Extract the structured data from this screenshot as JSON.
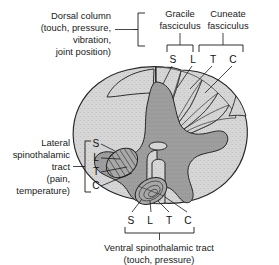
{
  "figure": {
    "colors": {
      "white_matter": "#d6d6d6",
      "gray_matter": "#9e9e9e",
      "dorsal_column_band": "#b0b0b0",
      "tract_fill": "#a8a8a8",
      "outline": "#262626",
      "text": "#1a1a1a",
      "background": "#ffffff"
    }
  },
  "labels": {
    "dorsal_column": {
      "lines": [
        "Dorsal column",
        "(touch, pressure,",
        "vibration,",
        "joint position)"
      ]
    },
    "gracile": {
      "lines": [
        "Gracile",
        "fasciculus"
      ]
    },
    "cuneate": {
      "lines": [
        "Cuneate",
        "fasciculus"
      ]
    },
    "lateral_spinothalamic": {
      "lines": [
        "Lateral",
        "spinothalamic",
        "tract",
        "(pain,",
        "temperature)"
      ]
    },
    "ventral_spinothalamic": {
      "lines": [
        "Ventral spinothalamic tract",
        "(touch, pressure)"
      ]
    }
  },
  "lamination": {
    "legend": {
      "S": "Sacral",
      "L": "Lumbar",
      "T": "Thoracic",
      "C": "Cervical"
    },
    "dorsal_column_letters": [
      "S",
      "L",
      "T",
      "C"
    ],
    "gracile_letters": [
      "S",
      "L"
    ],
    "cuneate_letters": [
      "T",
      "C"
    ],
    "lateral_tract_letters": [
      "S",
      "L",
      "T",
      "C"
    ],
    "ventral_tract_letters": [
      "S",
      "L",
      "T",
      "C"
    ]
  }
}
